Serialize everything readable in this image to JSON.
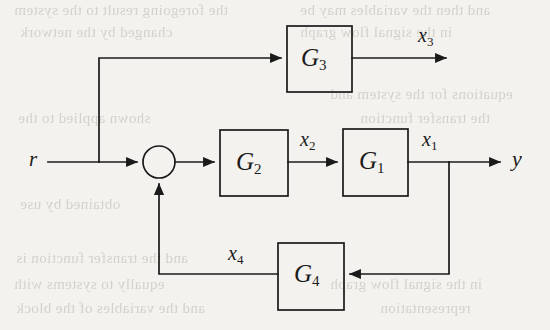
{
  "figure": {
    "kind": "control-system-block-diagram",
    "background_color": "#f3f2ee",
    "line_color": "#1b1b1b",
    "text_color": "#1b1b1b"
  },
  "signals": {
    "input": "r",
    "output": "y",
    "x1": "x",
    "x1_sub": "1",
    "x2": "x",
    "x2_sub": "2",
    "x3": "x",
    "x3_sub": "3",
    "x4": "x",
    "x4_sub": "4"
  },
  "blocks": [
    {
      "id": "G3",
      "label": "G",
      "subscript": "3",
      "x": 287,
      "y": 26,
      "w": 65,
      "h": 66
    },
    {
      "id": "G2",
      "label": "G",
      "subscript": "2",
      "x": 220,
      "y": 130,
      "w": 68,
      "h": 66
    },
    {
      "id": "G1",
      "label": "G",
      "subscript": "1",
      "x": 343,
      "y": 129,
      "w": 65,
      "h": 67
    },
    {
      "id": "G4",
      "label": "G",
      "subscript": "4",
      "x": 278,
      "y": 243,
      "w": 66,
      "h": 67
    }
  ],
  "summing_junction": {
    "cx": 159,
    "cy": 162,
    "r": 16
  },
  "ghost_text": [
    {
      "text": "the foregoing result to the system",
      "x": 14,
      "y": 4
    },
    {
      "text": "and then the variables may be",
      "x": 300,
      "y": 4
    },
    {
      "text": "changed by the network",
      "x": 20,
      "y": 24
    },
    {
      "text": "in the signal flow graph",
      "x": 300,
      "y": 24
    },
    {
      "text": "equations for the system and",
      "x": 300,
      "y": 88
    },
    {
      "text": "the transfer function",
      "x": 300,
      "y": 110
    },
    {
      "text": "shown applied to the",
      "x": 18,
      "y": 112
    },
    {
      "text": "obtained by use",
      "x": 300,
      "y": 132
    },
    {
      "text": "of the system",
      "x": 20,
      "y": 196
    },
    {
      "text": "and the transfer function is",
      "x": 16,
      "y": 252
    },
    {
      "text": "equally to systems with",
      "x": 14,
      "y": 276
    },
    {
      "text": "in the signal flow graph",
      "x": 300,
      "y": 276
    },
    {
      "text": "and the variables of the block",
      "x": 16,
      "y": 300
    },
    {
      "text": "representation",
      "x": 340,
      "y": 300
    }
  ]
}
